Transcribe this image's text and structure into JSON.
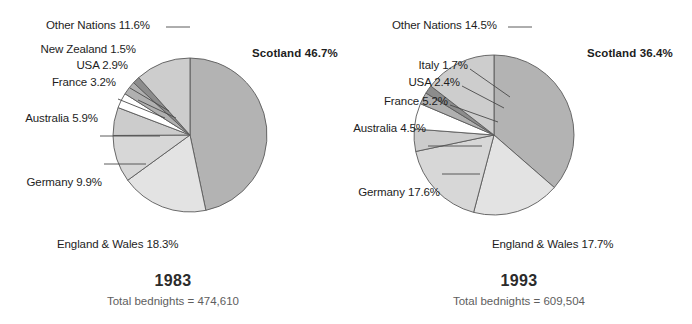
{
  "chart_data": [
    {
      "type": "pie",
      "title": "1983",
      "subtitle": "Total bednights = 474,610",
      "total_bednights": "474,610",
      "categories": [
        "Scotland",
        "England & Wales",
        "Germany",
        "Australia",
        "France",
        "USA",
        "New Zealand",
        "Other Nations"
      ],
      "values": [
        46.7,
        18.3,
        9.9,
        5.9,
        3.2,
        2.9,
        1.5,
        11.6
      ],
      "labels": [
        "Scotland  46.7%",
        "England & Wales 18.3%",
        "Germany 9.9%",
        "Australia 5.9%",
        "France 3.2%",
        "USA 2.9%",
        "New Zealand 1.5%",
        "Other Nations 11.6%"
      ],
      "colors": [
        "#b3b3b3",
        "#e3e3e3",
        "#d7d7d7",
        "#cccccc",
        "#ffffff",
        "#b0b0b0",
        "#8c8c8c",
        "#cdcdcd"
      ],
      "start_angle_deg": 0,
      "direction": "clockwise",
      "legend": "none",
      "grid": false
    },
    {
      "type": "pie",
      "title": "1993",
      "subtitle": "Total bednights = 609,504",
      "total_bednights": "609,504",
      "categories": [
        "Scotland",
        "England & Wales",
        "Germany",
        "Australia",
        "France",
        "USA",
        "Italy",
        "Other Nations"
      ],
      "values": [
        36.4,
        17.7,
        17.6,
        4.5,
        5.2,
        2.4,
        1.7,
        14.5
      ],
      "labels": [
        "Scotland  36.4%",
        "England & Wales 17.7%",
        "Germany 17.6%",
        "Australia 4.5%",
        "France 5.2%",
        "USA 2.4%",
        "Italy 1.7%",
        "Other Nations 14.5%"
      ],
      "colors": [
        "#b3b3b3",
        "#e3e3e3",
        "#d7d7d7",
        "#cccccc",
        "#ffffff",
        "#b0b0b0",
        "#8c8c8c",
        "#cdcdcd"
      ],
      "start_angle_deg": 0,
      "direction": "clockwise",
      "legend": "none",
      "grid": false
    }
  ],
  "charts": {
    "left": {
      "year": "1983",
      "total": "Total bednights = 474,610",
      "labels": {
        "scotland": "Scotland  46.7%",
        "england_wales": "England & Wales 18.3%",
        "germany": "Germany 9.9%",
        "australia": "Australia 5.9%",
        "france": "France 3.2%",
        "usa": "USA 2.9%",
        "new_zealand": "New Zealand 1.5%",
        "other_nations": "Other Nations 11.6%"
      }
    },
    "right": {
      "year": "1993",
      "total": "Total bednights = 609,504",
      "labels": {
        "scotland": "Scotland  36.4%",
        "england_wales": "England & Wales 17.7%",
        "germany": "Germany 17.6%",
        "australia": "Australia 4.5%",
        "france": "France 5.2%",
        "usa": "USA 2.4%",
        "italy": "Italy 1.7%",
        "other_nations": "Other Nations 14.5%"
      }
    }
  },
  "style": {
    "slice_outline": "#5a5a5a",
    "leader_line": "#4a4a4a",
    "text_color": "#1d1d1d",
    "subtitle_color": "#5e5e5e",
    "background": "#ffffff"
  }
}
